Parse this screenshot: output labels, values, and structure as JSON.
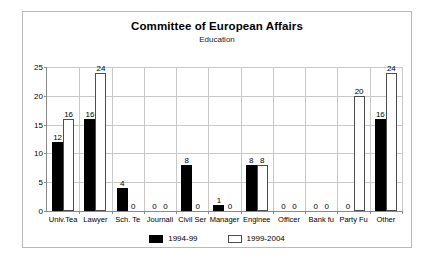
{
  "chart_data": {
    "type": "bar",
    "title": "Committee of European Affairs",
    "subtitle": "Education",
    "xlabel": "",
    "ylabel": "",
    "ylim": [
      0,
      25
    ],
    "yticks": [
      0,
      5,
      10,
      15,
      20,
      25
    ],
    "grid": true,
    "legend_position": "bottom",
    "categories": [
      "Univ.Tea",
      "Lawyer",
      "Sch. Te",
      "Journali",
      "Civil Ser",
      "Manager",
      "Enginee",
      "Officer",
      "Bank fu",
      "Party Fu",
      "Other"
    ],
    "series": [
      {
        "name": "1994-99",
        "color": "#000000",
        "values": [
          12,
          16,
          4,
          0,
          8,
          1,
          8,
          0,
          0,
          0,
          16
        ]
      },
      {
        "name": "1999-2004",
        "color": "#ffffff",
        "values": [
          16,
          24,
          0,
          0,
          0,
          0,
          8,
          0,
          0,
          20,
          24
        ]
      }
    ]
  },
  "legend": {
    "items": [
      {
        "label": "1994-99"
      },
      {
        "label": "1999-2004"
      }
    ]
  },
  "colors": {
    "series1": "#000000",
    "series2": "#ffffff",
    "frame": "#b9b9b9",
    "grid": "#c8c8c8",
    "axis": "#8a8a8a"
  }
}
